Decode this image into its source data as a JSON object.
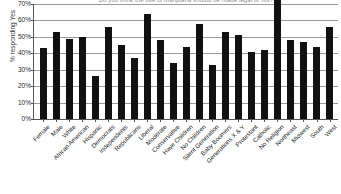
{
  "chart_data": {
    "type": "bar",
    "title": "Do you think the use of marijuana should be made legal or not?",
    "xlabel": "",
    "ylabel": "% responding Yes",
    "ylim": [
      0,
      70
    ],
    "ytick_labels": [
      "70%",
      "60%",
      "50%",
      "40%",
      "30%",
      "20%",
      "10%",
      "0%"
    ],
    "ytick_values": [
      70,
      60,
      50,
      40,
      30,
      20,
      10,
      0
    ],
    "grid": true,
    "legend": "none",
    "bar_color": "#111111",
    "categories": [
      "Female",
      "Male",
      "White",
      "African American",
      "Hispanic",
      "Democrats",
      "Independents",
      "Republicans",
      "Liberal",
      "Moderate",
      "Conservative",
      "Have Children",
      "No Children",
      "Silent Generation",
      "Baby Boomers",
      "Generations X & Y",
      "Protestant",
      "Catholic",
      "No Religion",
      "Northeast",
      "Midwest",
      "South",
      "West"
    ],
    "values": [
      43,
      53,
      49,
      50,
      26,
      56,
      45,
      37,
      64,
      48,
      34,
      44,
      58,
      33,
      53,
      51,
      41,
      42,
      73,
      48,
      47,
      44,
      56
    ]
  }
}
